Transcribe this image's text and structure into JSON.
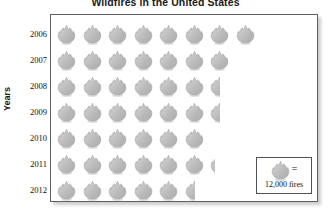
{
  "chart_data": {
    "type": "pictogram",
    "title": "Wildfires in the United States",
    "xlabel": "",
    "ylabel": "Years",
    "categories": [
      "2006",
      "2007",
      "2008",
      "2009",
      "2010",
      "2011",
      "2012"
    ],
    "values": [
      8,
      7,
      6.5,
      6.5,
      6,
      6.25,
      5.5
    ],
    "icon_unit_value": 12000,
    "icon_unit_label": "12,000 fires",
    "icon_name": "flame-icon",
    "grid": false,
    "legend_position": "bottom-right",
    "rows": [
      {
        "year": "2006",
        "icons": 8,
        "full": 8,
        "partial": 0,
        "fires": 96000
      },
      {
        "year": "2007",
        "icons": 7,
        "full": 7,
        "partial": 0,
        "fires": 84000
      },
      {
        "year": "2008",
        "icons": 6.5,
        "full": 6,
        "partial": 0.5,
        "fires": 78000
      },
      {
        "year": "2009",
        "icons": 6.5,
        "full": 6,
        "partial": 0.5,
        "fires": 78000
      },
      {
        "year": "2010",
        "icons": 6,
        "full": 6,
        "partial": 0,
        "fires": 72000
      },
      {
        "year": "2011",
        "icons": 6.25,
        "full": 6,
        "partial": 0.25,
        "fires": 75000
      },
      {
        "year": "2012",
        "icons": 5.5,
        "full": 5,
        "partial": 0.5,
        "fires": 66000
      }
    ]
  },
  "legend": {
    "equals_symbol": "=",
    "value_label": "12,000 fires"
  },
  "colors": {
    "flame_fill": "#b8b8b8",
    "flame_edge": "#8f8f8f",
    "frame": "#5b5f66",
    "text": "#111111"
  }
}
